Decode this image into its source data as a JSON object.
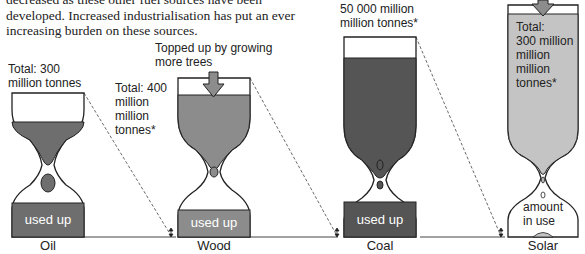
{
  "intro_text": {
    "line1": "decreased as these other fuel sources have been",
    "line2": "developed. Increased industrialisation has put an ever",
    "line3": "increasing burden on these sources."
  },
  "colors": {
    "oil": "#6e6e6e",
    "wood": "#8c8c8c",
    "coal": "#555555",
    "solar": "#c4c4c4",
    "outline": "#222222"
  },
  "hourglasses": [
    {
      "id": "oil",
      "caption": "Oil",
      "total_line1": "Total: 300",
      "total_line2": "million tonnes",
      "used_label": "used up"
    },
    {
      "id": "wood",
      "caption": "Wood",
      "topup_line1": "Topped up by growing",
      "topup_line2": "more trees",
      "total_line1": "Total: 400",
      "total_line2": "million",
      "total_line3": "million",
      "total_line4": "tonnes*",
      "used_label": "used up"
    },
    {
      "id": "coal",
      "caption": "Coal",
      "total_line1": "50 000 million",
      "total_line2": "million tonnes*",
      "used_label": "used up"
    },
    {
      "id": "solar",
      "caption": "Solar",
      "total_line1": "Total:",
      "total_line2": "300 million",
      "total_line3": "million",
      "total_line4": "million",
      "total_line5": "tonnes*",
      "use_line1": "amount",
      "use_line2": "in use"
    }
  ]
}
